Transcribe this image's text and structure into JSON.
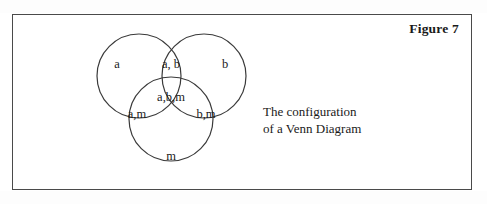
{
  "figure": {
    "title": "Figure 7",
    "caption_lines": [
      "The configuration",
      "of a Venn Diagram"
    ]
  },
  "diagram": {
    "type": "venn-3-set",
    "stroke_color": "#3a3a3a",
    "fill": "none",
    "circles": [
      {
        "name": "set-a",
        "cx": 126,
        "cy": 61,
        "r": 42
      },
      {
        "name": "set-b",
        "cx": 191,
        "cy": 61,
        "r": 42
      },
      {
        "name": "set-m",
        "cx": 158,
        "cy": 104,
        "r": 42
      }
    ],
    "regions": [
      {
        "id": "a-only",
        "label": "a",
        "x": 104,
        "y": 49
      },
      {
        "id": "a-and-b",
        "label": "a, b",
        "x": 158,
        "y": 49
      },
      {
        "id": "b-only",
        "label": "b",
        "x": 212,
        "y": 49
      },
      {
        "id": "a-b-m",
        "label": "a,b,m",
        "x": 158,
        "y": 82
      },
      {
        "id": "a-and-m",
        "label": "a,m",
        "x": 124,
        "y": 99
      },
      {
        "id": "b-and-m",
        "label": "b,m",
        "x": 193,
        "y": 99
      },
      {
        "id": "m-only",
        "label": "m",
        "x": 158,
        "y": 141
      }
    ]
  }
}
